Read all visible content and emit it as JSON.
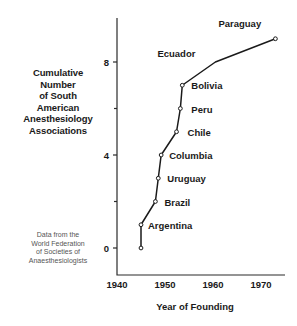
{
  "chart_data": {
    "type": "line",
    "title": "",
    "xlabel": "Year of Founding",
    "ylabel": "Cumulative Number of South American Anesthesiology Associations",
    "ylabel_lines": [
      "Cumulative",
      "Number",
      "of South",
      "American",
      "Anesthesiology",
      "Associations"
    ],
    "source_note_lines": [
      "Data from the",
      "World Federation",
      "of Societies of",
      "Anaesthesiologists"
    ],
    "xlim": [
      1938,
      1975
    ],
    "ylim": [
      0,
      9.8
    ],
    "grid": false,
    "legend": "none",
    "x_ticks": [
      1940,
      1950,
      1960,
      1970
    ],
    "x_tick_labels": [
      "1940",
      "1950",
      "1960",
      "1970"
    ],
    "y_ticks": [
      0,
      2,
      4,
      6,
      8,
      9.6
    ],
    "y_tick_labels": [
      "0",
      "",
      "4",
      "",
      "8",
      ""
    ],
    "y_major_ticks": [
      0,
      4,
      8
    ],
    "y_minor_ticks": [
      2,
      6
    ],
    "line_color": "#1a1a1a",
    "marker": "open-circle",
    "points": [
      {
        "label": "",
        "x": 1945,
        "y": 0
      },
      {
        "label": "Argentina",
        "x": 1945,
        "y": 1
      },
      {
        "label": "Brazil",
        "x": 1948,
        "y": 2
      },
      {
        "label": "Uruguay",
        "x": 1948.6,
        "y": 3
      },
      {
        "label": "Columbia",
        "x": 1949.2,
        "y": 4
      },
      {
        "label": "Chile",
        "x": 1952.4,
        "y": 5
      },
      {
        "label": "Peru",
        "x": 1953.2,
        "y": 6
      },
      {
        "label": "Bolivia",
        "x": 1953.6,
        "y": 7
      },
      {
        "label": "Ecuador",
        "x": 1960.5,
        "y": 8
      },
      {
        "label": "Paraguay",
        "x": 1973,
        "y": 9
      }
    ]
  }
}
